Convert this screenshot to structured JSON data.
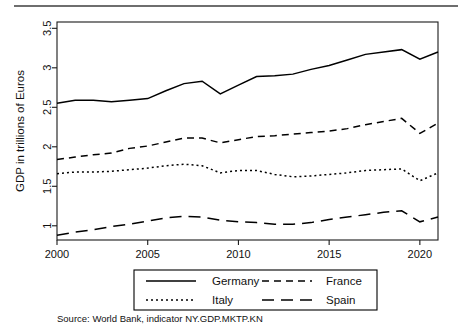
{
  "chart_data": {
    "type": "line",
    "title": "",
    "xlabel": "",
    "ylabel": "GDP in trillions of Euros",
    "xlim": [
      2000,
      2021
    ],
    "ylim": [
      0.82,
      3.58
    ],
    "grid": false,
    "legend_position": "bottom",
    "x": [
      2000,
      2001,
      2002,
      2003,
      2004,
      2005,
      2006,
      2007,
      2008,
      2009,
      2010,
      2011,
      2012,
      2013,
      2014,
      2015,
      2016,
      2017,
      2018,
      2019,
      2020,
      2021
    ],
    "xticks": [
      "2000",
      "2005",
      "2010",
      "2015",
      "2020"
    ],
    "xtick_values": [
      2000,
      2005,
      2010,
      2015,
      2020
    ],
    "yticks": [
      "1",
      "1.5",
      "2",
      "2.5",
      "3",
      "3.5"
    ],
    "ytick_values": [
      1,
      1.5,
      2,
      2.5,
      3,
      3.5
    ],
    "series": [
      {
        "name": "Germany",
        "style": "solid",
        "values": [
          2.55,
          2.59,
          2.59,
          2.57,
          2.59,
          2.61,
          2.71,
          2.8,
          2.83,
          2.67,
          2.78,
          2.89,
          2.9,
          2.92,
          2.98,
          3.03,
          3.1,
          3.17,
          3.2,
          3.23,
          3.11,
          3.2
        ]
      },
      {
        "name": "France",
        "style": "dashed",
        "values": [
          1.84,
          1.87,
          1.9,
          1.92,
          1.98,
          2.01,
          2.06,
          2.11,
          2.11,
          2.05,
          2.09,
          2.13,
          2.14,
          2.16,
          2.18,
          2.2,
          2.23,
          2.28,
          2.32,
          2.36,
          2.17,
          2.3
        ]
      },
      {
        "name": "Italy",
        "style": "dotted",
        "values": [
          1.66,
          1.68,
          1.68,
          1.69,
          1.71,
          1.73,
          1.76,
          1.78,
          1.76,
          1.67,
          1.7,
          1.7,
          1.65,
          1.62,
          1.63,
          1.65,
          1.67,
          1.7,
          1.71,
          1.72,
          1.57,
          1.67
        ]
      },
      {
        "name": "Spain",
        "style": "longdash",
        "values": [
          0.88,
          0.92,
          0.95,
          0.99,
          1.02,
          1.06,
          1.1,
          1.12,
          1.11,
          1.07,
          1.05,
          1.04,
          1.02,
          1.02,
          1.04,
          1.08,
          1.11,
          1.14,
          1.17,
          1.19,
          1.05,
          1.11
        ]
      }
    ],
    "source_note": "Source: World Bank, indicator NY.GDP.MKTP.KN"
  },
  "legend": {
    "entries": [
      {
        "label": "Germany",
        "style": "solid"
      },
      {
        "label": "France",
        "style": "dashed"
      },
      {
        "label": "Italy",
        "style": "dotted"
      },
      {
        "label": "Spain",
        "style": "longdash"
      }
    ]
  },
  "colors": {
    "ink": "#000000",
    "rule": "#6e6e6e",
    "background": "#ffffff"
  }
}
